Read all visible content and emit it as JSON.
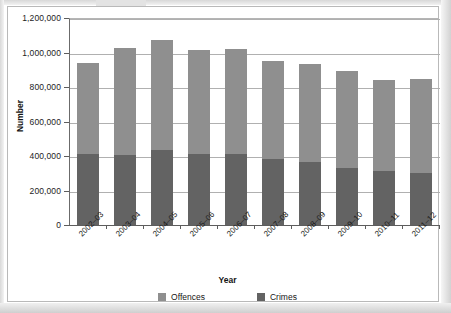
{
  "chart_data": {
    "type": "bar",
    "subtype": "stacked-bar",
    "title": "",
    "xlabel": "Year",
    "ylabel": "Number",
    "ylim": [
      0,
      1200000
    ],
    "ytick_step": 200000,
    "ytick_labels": [
      "1,200,000",
      "1,000,000",
      "800,000",
      "600,000",
      "400,000",
      "200,000",
      "0"
    ],
    "ytick_values": [
      1200000,
      1000000,
      800000,
      600000,
      400000,
      200000,
      0
    ],
    "grid": true,
    "grid_axis": "y",
    "legend_position": "bottom",
    "categories": [
      "2002–03",
      "2003–04",
      "2004–05",
      "2005–06",
      "2006–07",
      "2007–08",
      "2008–09",
      "2009–10",
      "2010–11",
      "2011–12"
    ],
    "series": [
      {
        "name": "Crimes",
        "color": "#636363",
        "values": [
          410000,
          408000,
          432000,
          410000,
          410000,
          380000,
          368000,
          330000,
          313000,
          302000
        ]
      },
      {
        "name": "Offences",
        "color": "#8f8f8f",
        "values": [
          528000,
          620000,
          638000,
          602000,
          610000,
          572000,
          563000,
          560000,
          529000,
          543000
        ]
      }
    ],
    "totals": [
      938000,
      1028000,
      1070000,
      1012000,
      1020000,
      952000,
      931000,
      890000,
      842000,
      845000
    ]
  },
  "axes": {
    "y_title": "Number",
    "x_title": "Year"
  },
  "legend": {
    "items": [
      {
        "label": "Offences",
        "color": "#8f8f8f"
      },
      {
        "label": "Crimes",
        "color": "#636363"
      }
    ]
  }
}
